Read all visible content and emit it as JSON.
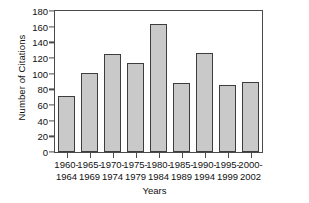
{
  "chart_data": {
    "type": "bar",
    "title": "",
    "xlabel": "Years",
    "ylabel": "Number of Citations",
    "categories": [
      "1960-1964",
      "1965-1969",
      "1970-1974",
      "1975-1979",
      "1980-1984",
      "1985-1989",
      "1990-1994",
      "1995-1999",
      "2000-2002"
    ],
    "category_lines": [
      [
        "1960-",
        "1964"
      ],
      [
        "1965-",
        "1969"
      ],
      [
        "1970-",
        "1974"
      ],
      [
        "1975-",
        "1979"
      ],
      [
        "1980-",
        "1984"
      ],
      [
        "1985-",
        "1989"
      ],
      [
        "1990-",
        "1994"
      ],
      [
        "1995-",
        "1999"
      ],
      [
        "2000-",
        "2002"
      ]
    ],
    "values": [
      72,
      101,
      125,
      114,
      164,
      88,
      126,
      86,
      90
    ],
    "ylim": [
      0,
      180
    ],
    "yticks": [
      0,
      20,
      40,
      60,
      80,
      100,
      120,
      140,
      160,
      180
    ],
    "ytick_labels": [
      "0",
      "20",
      "40",
      "60",
      "80",
      "100",
      "120",
      "140",
      "160",
      "180"
    ],
    "grid": false,
    "legend": null,
    "bar_fill_color": "#c9c9c9",
    "bar_edge_color": "#3d3d3d",
    "axis_color": "#4a4a4a",
    "background_color": "#ffffff"
  }
}
